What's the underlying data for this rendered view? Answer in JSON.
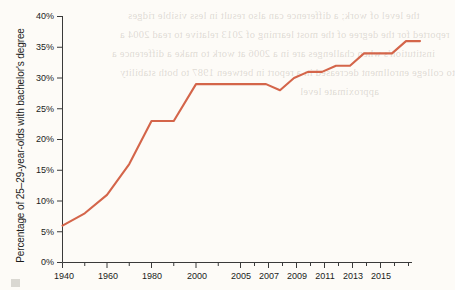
{
  "chart_data": {
    "type": "line",
    "title": "",
    "xlabel": "",
    "ylabel": "Percentage of 25–29-year-olds with bachelor's degree",
    "ylim": [
      0,
      40
    ],
    "ytick_labels": [
      "0%",
      "5%",
      "10%",
      "15%",
      "20%",
      "25%",
      "30%",
      "35%",
      "40%"
    ],
    "ytick_values": [
      0,
      5,
      10,
      15,
      20,
      25,
      30,
      35,
      40
    ],
    "xtick_labels": [
      "1940",
      "1960",
      "1980",
      "2000",
      "2005",
      "2007",
      "2009",
      "2011",
      "2013",
      "2015"
    ],
    "xtick_minor_labels": [
      "1950",
      "1970",
      "1990",
      "2006",
      "2008",
      "2010",
      "2012",
      "2014",
      "2016"
    ],
    "grid": false,
    "legend": "none",
    "series": [
      {
        "name": "Percentage of 25–29-year-olds with bachelor's degree",
        "color": "#d4654a",
        "x": [
          "1940",
          "1950",
          "1960",
          "1970",
          "1980",
          "1990",
          "2000",
          "2005",
          "2006",
          "2007",
          "2008",
          "2009",
          "2010",
          "2011",
          "2012",
          "2013",
          "2014",
          "2015",
          "2016"
        ],
        "values": [
          6,
          8,
          11,
          16,
          23,
          23,
          29,
          29,
          28,
          30,
          31,
          31,
          32,
          32,
          34,
          34,
          34,
          36,
          36
        ]
      }
    ]
  },
  "axis": {
    "line_color": "#3a3a3a",
    "text_color": "#1b1b1b"
  },
  "background": {
    "page_color": "#fdfbf7",
    "bleed_text_lines": [
      "the level of work; a difference can also result in less visible ridges",
      "reported for the degree of the most learning of 2013 relative to read 2004 a",
      "institution's when challenges are in a 2006 at work to make a difference a",
      "to college enrollment decreased in a report in between 1987 to both  stability",
      "approximate level"
    ]
  }
}
